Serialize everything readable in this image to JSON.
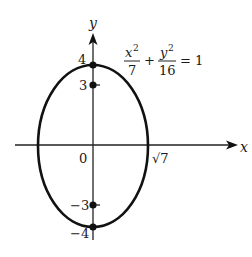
{
  "diagram": {
    "type": "ellipse-graph",
    "equation": {
      "term1_numerator": "x",
      "term1_exponent": "2",
      "term1_denominator": "7",
      "plus": "+",
      "term2_numerator": "y",
      "term2_exponent": "2",
      "term2_denominator": "16",
      "equals": "= 1"
    },
    "axes": {
      "x_label": "x",
      "y_label": "y"
    },
    "labels": {
      "origin": "0",
      "x_intercept": "√7",
      "y_top_vertex": "4",
      "y_top_focus": "3",
      "y_bottom_focus": "−3",
      "y_bottom_vertex": "−4"
    },
    "points": [
      {
        "name": "vertex-top",
        "x": 0,
        "y": 4
      },
      {
        "name": "focus-top",
        "x": 0,
        "y": 3
      },
      {
        "name": "focus-bottom",
        "x": 0,
        "y": -3
      },
      {
        "name": "vertex-bottom",
        "x": 0,
        "y": -4
      }
    ],
    "colors": {
      "stroke": "#111111",
      "background": "#ffffff"
    }
  }
}
